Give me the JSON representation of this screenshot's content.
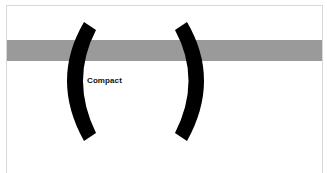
{
  "canvas": {
    "background": "#ffffff",
    "frame_color": "#d8d8d8",
    "band_color": "#9a9a9a",
    "glyph_color": "#000000"
  },
  "glyphs": {
    "left": "(",
    "right": ")"
  },
  "label": {
    "text": "Compact"
  }
}
